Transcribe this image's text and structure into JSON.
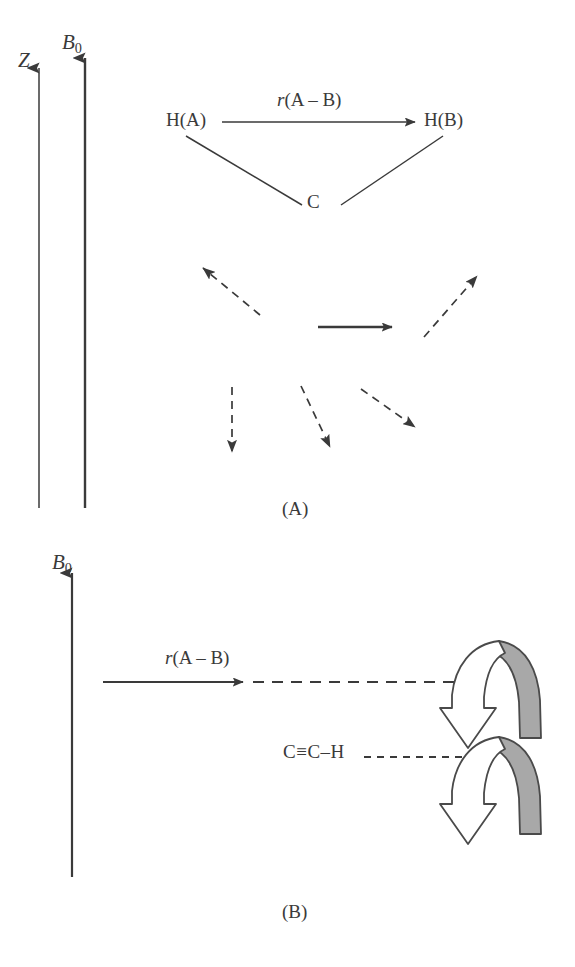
{
  "figure": {
    "background_color": "#ffffff",
    "ink_color": "#3a3a3a",
    "ribbon_fill_color": "#a8a8a8",
    "ribbon_outline_color": "#4a4a4a"
  },
  "panel_a": {
    "caption": "(A)",
    "axis_z_label": "Z",
    "axis_b0_label": "B",
    "axis_b0_subscript": "0",
    "molecule": {
      "atom_left": "H(A)",
      "atom_right": "H(B)",
      "atom_bottom": "C",
      "distance_label_italic": "r",
      "distance_label_rest": "(A – B)"
    },
    "vectors": [
      {
        "name": "dashed-arrow-up-left",
        "style": "dashed",
        "direction": "up-left"
      },
      {
        "name": "dashed-arrow-up-right",
        "style": "dashed",
        "direction": "up-right"
      },
      {
        "name": "solid-arrow-right",
        "style": "solid",
        "direction": "right"
      },
      {
        "name": "dashed-arrow-down",
        "style": "dashed",
        "direction": "down"
      },
      {
        "name": "dashed-arrow-down-right-steep",
        "style": "dashed",
        "direction": "down-right"
      },
      {
        "name": "dashed-arrow-down-right-shallow",
        "style": "dashed",
        "direction": "down-right"
      }
    ]
  },
  "panel_b": {
    "caption": "(B)",
    "axis_b0_label": "B",
    "axis_b0_subscript": "0",
    "distance_label_italic": "r",
    "distance_label_rest": "(A – B)",
    "molecule_label": "C≡C–H",
    "curved_arrows": [
      {
        "name": "curved-ribbon-arrow-upper",
        "direction": "down"
      },
      {
        "name": "curved-ribbon-arrow-lower",
        "direction": "down"
      }
    ]
  }
}
